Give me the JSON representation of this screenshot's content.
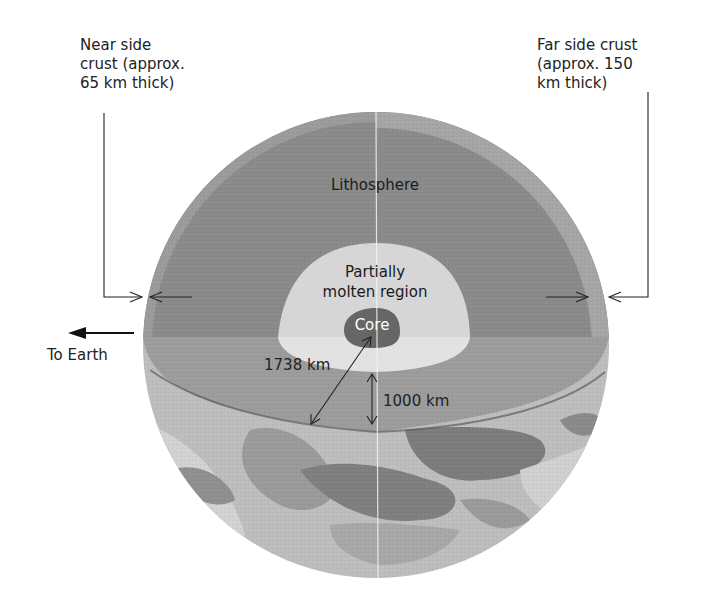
{
  "diagram": {
    "labels": {
      "near_side": "Near side\ncrust (approx.\n65 km thick)",
      "far_side": "Far side crust\n(approx. 150\nkm thick)",
      "lithosphere": "Lithosphere",
      "partially_molten_line1": "Partially",
      "partially_molten_line2": "molten region",
      "core": "Core",
      "radius": "1738 km",
      "depth": "1000 km",
      "to_earth": "To Earth"
    },
    "measurements": {
      "near_side_crust_km": 65,
      "far_side_crust_km": 150,
      "radius_km": 1738,
      "lithosphere_depth_km": 1000
    },
    "colors": {
      "lithosphere": "#8a8a8a",
      "lithosphere_rim": "#a8a8a8",
      "cut_surface": "#9c9c9c",
      "molten_region": "#d6d6d6",
      "molten_cut": "#e0e0e0",
      "core": "#6a6a6a",
      "surface_dark": "#7e7e7e",
      "surface_mid": "#a6a6a6",
      "surface_light": "#d0d0d0",
      "line": "#222222"
    }
  }
}
